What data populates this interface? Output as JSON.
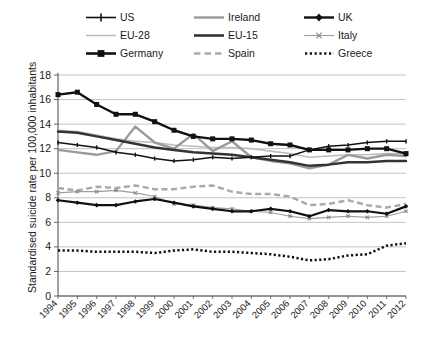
{
  "chart_data": {
    "type": "line",
    "title": "",
    "xlabel": "",
    "ylabel": "Standardised suicide rate per 100,000 inhabitants",
    "x": [
      "1994",
      "1995",
      "1996",
      "1997",
      "1998",
      "1999",
      "2000",
      "2001",
      "2002",
      "2003",
      "2004",
      "2005",
      "2006",
      "2007",
      "2008",
      "2009",
      "2010",
      "2011",
      "2012"
    ],
    "ylim": [
      0,
      18
    ],
    "yticks": [
      0,
      2,
      4,
      6,
      8,
      10,
      12,
      14,
      16,
      18
    ],
    "grid": "horizontal",
    "legend_position": "top",
    "series": [
      {
        "name": "US",
        "style": "solid-thin-dark-plus-markers",
        "color": "#111111",
        "values": [
          12.5,
          12.3,
          12.1,
          11.7,
          11.5,
          11.2,
          11.0,
          11.1,
          11.3,
          11.2,
          11.3,
          11.4,
          11.4,
          11.9,
          12.2,
          12.3,
          12.5,
          12.6,
          12.6
        ]
      },
      {
        "name": "EU-28",
        "style": "solid-thin-lightgrey",
        "color": "#b5b5b5",
        "values": [
          13.5,
          13.4,
          13.1,
          12.8,
          12.6,
          12.5,
          12.3,
          12.2,
          12.1,
          12.1,
          12.0,
          11.8,
          11.6,
          11.3,
          11.4,
          11.5,
          11.5,
          11.6,
          11.6
        ]
      },
      {
        "name": "Germany",
        "style": "solid-thick-black-square-markers",
        "color": "#111111",
        "values": [
          16.4,
          16.6,
          15.6,
          14.8,
          14.8,
          14.2,
          13.5,
          13.0,
          12.8,
          12.8,
          12.7,
          12.4,
          12.3,
          11.9,
          11.9,
          11.9,
          12.0,
          12.0,
          11.6
        ]
      },
      {
        "name": "Ireland",
        "style": "solid-medium-grey",
        "color": "#9a9a9a",
        "values": [
          11.9,
          11.7,
          11.5,
          11.8,
          13.8,
          12.5,
          12.0,
          13.2,
          11.8,
          12.6,
          11.3,
          11.0,
          10.8,
          10.4,
          10.7,
          11.5,
          11.2,
          11.5,
          11.4
        ]
      },
      {
        "name": "EU-15",
        "style": "solid-thick-darkgrey",
        "color": "#3a3a3a",
        "values": [
          13.4,
          13.3,
          13.0,
          12.7,
          12.4,
          12.1,
          11.9,
          11.7,
          11.6,
          11.5,
          11.3,
          11.1,
          10.9,
          10.6,
          10.7,
          10.9,
          10.9,
          11.0,
          11.0
        ]
      },
      {
        "name": "Spain",
        "style": "dashed-grey",
        "color": "#a8a8a8",
        "values": [
          8.8,
          8.6,
          8.9,
          8.8,
          9.0,
          8.7,
          8.7,
          8.9,
          9.0,
          8.5,
          8.3,
          8.3,
          8.1,
          7.4,
          7.5,
          7.8,
          7.4,
          7.2,
          7.5
        ]
      },
      {
        "name": "UK",
        "style": "solid-thick-black-diamond-markers",
        "color": "#111111",
        "values": [
          7.8,
          7.6,
          7.4,
          7.4,
          7.7,
          7.9,
          7.6,
          7.3,
          7.1,
          6.9,
          6.9,
          7.1,
          6.9,
          6.5,
          7.0,
          6.9,
          6.9,
          6.7,
          7.3
        ]
      },
      {
        "name": "Italy",
        "style": "solid-thin-grey-x-markers",
        "color": "#8f8f8f",
        "values": [
          8.4,
          8.5,
          8.5,
          8.6,
          8.4,
          8.1,
          7.5,
          7.4,
          7.2,
          7.1,
          6.9,
          6.8,
          6.5,
          6.3,
          6.4,
          6.5,
          6.4,
          6.5,
          6.9
        ]
      },
      {
        "name": "Greece",
        "style": "dotted-black",
        "color": "#111111",
        "values": [
          3.7,
          3.7,
          3.6,
          3.6,
          3.6,
          3.5,
          3.7,
          3.8,
          3.6,
          3.6,
          3.5,
          3.4,
          3.2,
          2.9,
          3.0,
          3.3,
          3.4,
          4.1,
          4.3
        ]
      }
    ]
  },
  "legend": {
    "entries": [
      {
        "label": "US",
        "marker": "line-plus"
      },
      {
        "label": "Ireland",
        "marker": "line-grey"
      },
      {
        "label": "UK",
        "marker": "line-diamond"
      },
      {
        "label": "EU-28",
        "marker": "line-lightgrey"
      },
      {
        "label": "EU-15",
        "marker": "line-darkgrey"
      },
      {
        "label": "Italy",
        "marker": "line-x"
      },
      {
        "label": "Germany",
        "marker": "line-square"
      },
      {
        "label": "Spain",
        "marker": "dashed"
      },
      {
        "label": "Greece",
        "marker": "dotted"
      }
    ]
  },
  "axes": {
    "y_axis_title": "Standardised suicide rate per 100,000 inhabitants",
    "y_tick_labels": [
      "0",
      "2",
      "4",
      "6",
      "8",
      "10",
      "12",
      "14",
      "16",
      "18"
    ],
    "x_tick_labels": [
      "1994",
      "1995",
      "1996",
      "1997",
      "1998",
      "1999",
      "2000",
      "2001",
      "2002",
      "2003",
      "2004",
      "2005",
      "2006",
      "2007",
      "2008",
      "2009",
      "2010",
      "2011",
      "2012"
    ]
  }
}
